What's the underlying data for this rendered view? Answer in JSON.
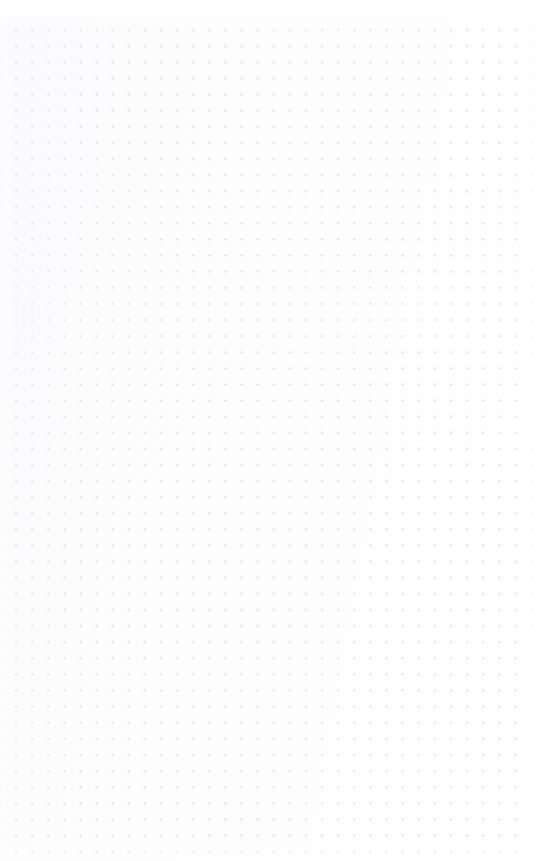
{
  "page": {
    "kind": "dot-grid-sheet",
    "width_px": 539,
    "height_px": 861,
    "content_text": "",
    "notes_label": "Blank dot grid page"
  },
  "grid": {
    "dot_spacing_px": 16.12,
    "dot_radius_px": 0.62,
    "columns": 33,
    "rows": 53,
    "origin_x_px": 8,
    "origin_y_px": 22,
    "dot_color": "#d8d8e0",
    "background_color": "#fdfdfe",
    "paper_white": "#ffffff"
  },
  "margins": {
    "top_blank_px": 15,
    "right_blank_px": 9,
    "left_px": 8,
    "bottom_px": 0
  }
}
